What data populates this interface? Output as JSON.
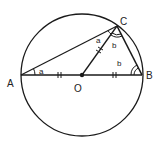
{
  "diagram": {
    "points": {
      "A": {
        "label": "A",
        "x": 21,
        "y": 75
      },
      "B": {
        "label": "B",
        "x": 142,
        "y": 75
      },
      "C": {
        "label": "C",
        "x": 117,
        "y": 26
      },
      "O": {
        "label": "O",
        "x": 82,
        "y": 75
      }
    },
    "circle": {
      "cx": 82,
      "cy": 75,
      "r": 61
    },
    "angle_labels": {
      "at_A": "a",
      "at_C_upper": "a",
      "at_C_lower": "b",
      "at_B": "b"
    },
    "colors": {
      "stroke": "#1a1a1a",
      "background": "#ffffff"
    }
  }
}
